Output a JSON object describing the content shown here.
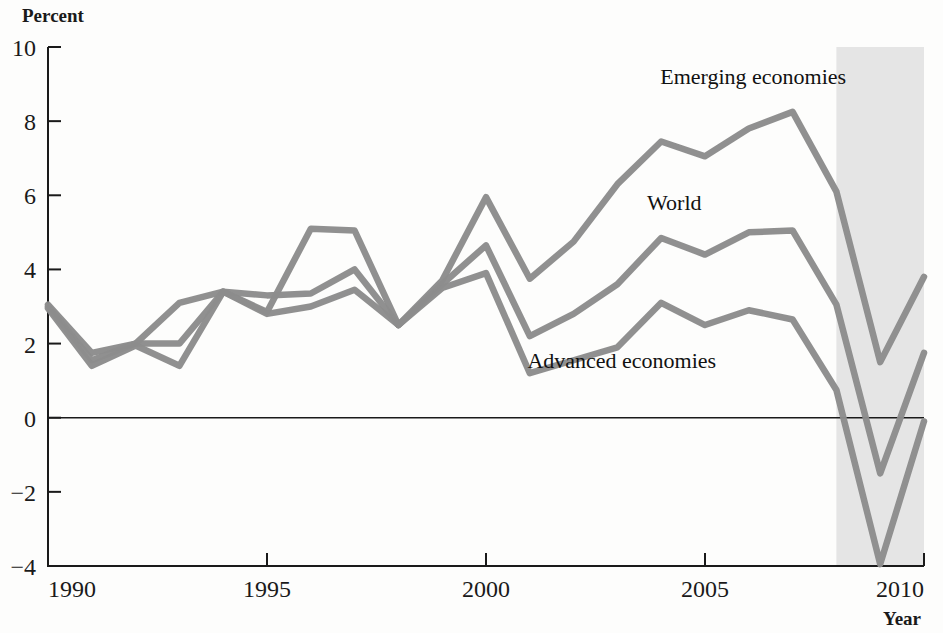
{
  "chart_data": {
    "type": "line",
    "title": "",
    "subtitle": "",
    "ylabel": "Percent",
    "xlabel": "Year",
    "xlim": [
      1990,
      2010
    ],
    "ylim": [
      -4,
      10
    ],
    "ytick_labels": [
      "10",
      "8",
      "6",
      "4",
      "2",
      "0",
      "−2",
      "−4"
    ],
    "yticks": [
      10,
      8,
      6,
      4,
      2,
      0,
      -2,
      -4
    ],
    "xtick_labels": [
      "1990",
      "1995",
      "2000",
      "2005",
      "2010"
    ],
    "xticks": [
      1990,
      1995,
      2000,
      2005,
      2010
    ],
    "grid": false,
    "legend_position": "inline-annotations",
    "line_color": "#8c8c8c",
    "shaded_region": {
      "label": "projection",
      "x_start": 2008,
      "x_end": 2010,
      "color": "#e4e4e4"
    },
    "x": [
      1990,
      1991,
      1992,
      1993,
      1994,
      1995,
      1996,
      1997,
      1998,
      1999,
      2000,
      2001,
      2002,
      2003,
      2004,
      2005,
      2006,
      2007,
      2008,
      2009,
      2010
    ],
    "series": [
      {
        "name": "Emerging economies",
        "label": "Emerging economies",
        "color": "#8c8c8c",
        "label_x": 2006.1,
        "label_y": 9.0,
        "values": [
          3.05,
          1.75,
          2.0,
          3.1,
          3.4,
          2.85,
          5.1,
          5.05,
          2.5,
          3.7,
          5.95,
          3.75,
          4.75,
          6.3,
          7.45,
          7.05,
          7.8,
          8.25,
          6.1,
          1.5,
          3.8
        ]
      },
      {
        "name": "World",
        "label": "World",
        "color": "#8c8c8c",
        "label_x": 2004.3,
        "label_y": 5.6,
        "values": [
          3.0,
          1.55,
          2.0,
          2.0,
          3.4,
          3.3,
          3.35,
          4.0,
          2.5,
          3.6,
          4.65,
          2.2,
          2.8,
          3.6,
          4.85,
          4.4,
          5.0,
          5.05,
          3.05,
          -1.5,
          1.75
        ]
      },
      {
        "name": "Advanced economies",
        "label": "Advanced economies",
        "color": "#8c8c8c",
        "label_x": 2003.1,
        "label_y": 1.35,
        "values": [
          2.95,
          1.4,
          1.95,
          1.4,
          3.4,
          2.8,
          3.0,
          3.45,
          2.5,
          3.5,
          3.9,
          1.2,
          1.55,
          1.9,
          3.1,
          2.5,
          2.9,
          2.65,
          0.75,
          -3.95,
          -0.1
        ]
      }
    ]
  }
}
